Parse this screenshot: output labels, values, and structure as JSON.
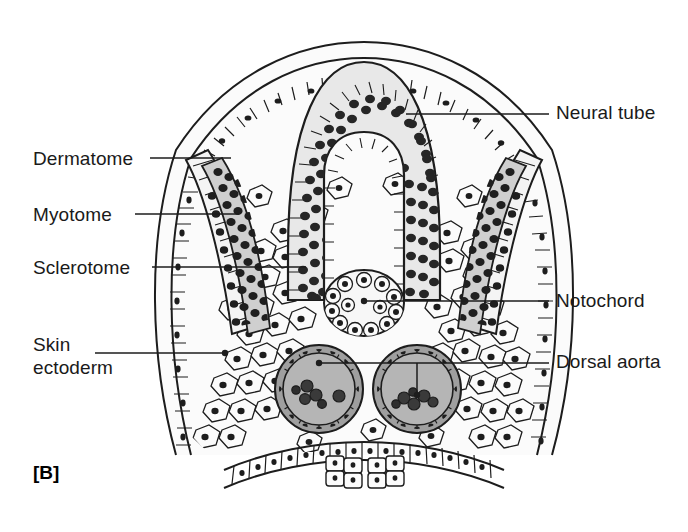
{
  "figure": {
    "panel_label": "[B]",
    "caption_title": "Transverse section of embryo trunk",
    "background_color": "#ffffff",
    "ink_color": "#1d1d1d"
  },
  "labels": {
    "left": [
      {
        "id": "dermatome",
        "text": "Dermatome",
        "x": 33,
        "y": 147
      },
      {
        "id": "myotome",
        "text": "Myotome",
        "x": 33,
        "y": 203
      },
      {
        "id": "sclerotome",
        "text": "Sclerotome",
        "x": 33,
        "y": 256
      },
      {
        "id": "skin-ectoderm",
        "text": "Skin\nectoderm",
        "x": 33,
        "y": 333
      }
    ],
    "right": [
      {
        "id": "neural-tube",
        "text": "Neural tube",
        "x": 556,
        "y": 101
      },
      {
        "id": "notochord",
        "text": "Notochord",
        "x": 556,
        "y": 289
      },
      {
        "id": "dorsal-aorta",
        "text": "Dorsal aorta",
        "x": 556,
        "y": 350
      }
    ]
  },
  "leaders": [
    {
      "id": "dermatome-leader",
      "path": "M150 158 L231 158"
    },
    {
      "id": "myotome-leader",
      "path": "M135 214 L239 214"
    },
    {
      "id": "sclerotome-leader",
      "path": "M152 267 L306 267"
    },
    {
      "id": "skin-ectoderm-leader",
      "path": "M95 353 L225 353"
    },
    {
      "id": "neural-tube-leader",
      "path": "M406 114 L549 114"
    },
    {
      "id": "notochord-leader",
      "path": "M364 301 L549 301"
    },
    {
      "id": "dorsal-aorta-leader",
      "path": "M319 363 L549 363"
    },
    {
      "id": "dorsal-aorta-stub",
      "path": "M417 363 L417 395"
    }
  ],
  "leader_dots": [
    {
      "id": "notochord-dot",
      "cx": 364,
      "cy": 301,
      "r": 3.2
    },
    {
      "id": "skin-ectoderm-dot",
      "cx": 225,
      "cy": 353,
      "r": 3.2
    },
    {
      "id": "aorta-left-dot",
      "cx": 319,
      "cy": 363,
      "r": 3.2
    },
    {
      "id": "aorta-right-dot",
      "cx": 417,
      "cy": 395,
      "r": 3.2
    }
  ],
  "structures": {
    "neural_tube": {
      "name": "Neural tube",
      "description": "Inverted U-shaped pseudostratified neuroepithelium with central lumen",
      "fill": "#e8e8e8",
      "nuclei_color": "#2a2a2a"
    },
    "notochord": {
      "name": "Notochord",
      "description": "Oval cord of vacuolated cells with peripheral nuclei ring",
      "fill": "#f2f2f2",
      "center": {
        "cx": 364,
        "cy": 303,
        "rx": 40,
        "ry": 33
      },
      "peripheral_cells": 13
    },
    "dorsal_aorta": {
      "name": "Dorsal aorta",
      "description": "Paired endothelial tubes containing primitive blood cells",
      "count": 2,
      "lumen_fill": "#b5b5b5",
      "left": {
        "cx": 319,
        "cy": 389,
        "r": 44
      },
      "right": {
        "cx": 417,
        "cy": 389,
        "r": 44
      },
      "blood_cells_left": 6,
      "blood_cells_right": 6
    },
    "somite": {
      "name": "Somite derivatives",
      "parts": [
        "Dermatome",
        "Myotome",
        "Sclerotome"
      ],
      "dermatome_description": "Outer epithelial plate of somite",
      "myotome_description": "Dense dark band of myoblasts beneath dermatome",
      "sclerotome_description": "Loose mesenchymal cells migrating toward notochord"
    },
    "skin_ectoderm": {
      "name": "Skin ectoderm",
      "description": "Single outer layer of cuboidal surface ectoderm cells"
    },
    "endoderm": {
      "name": "Gut endoderm",
      "description": "Ventral epithelial sheet forming the gut roof"
    }
  }
}
